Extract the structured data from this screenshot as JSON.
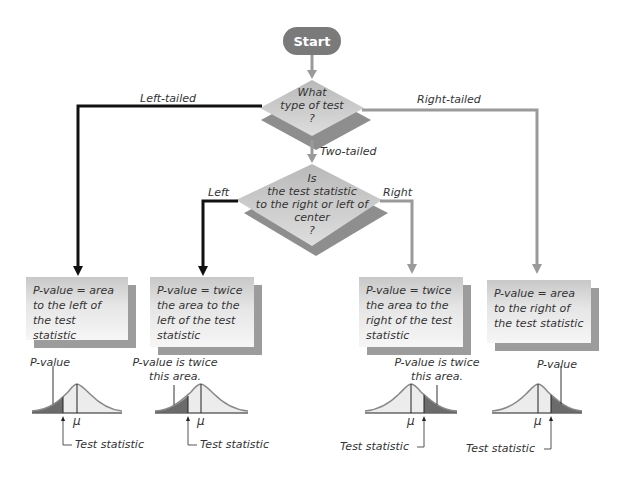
{
  "start": {
    "label": "Start"
  },
  "decision1": {
    "lines": [
      "What",
      "type of test",
      "?"
    ]
  },
  "decision2": {
    "lines": [
      "Is",
      "the test statistic",
      "to the right or left of",
      "center",
      "?"
    ]
  },
  "branches": {
    "left_tailed": "Left-tailed",
    "right_tailed": "Right-tailed",
    "two_tailed": "Two-tailed",
    "left": "Left",
    "right": "Right"
  },
  "boxes": [
    {
      "text": "P-value = area to the left of the test statistic"
    },
    {
      "text": "P-value = twice the area to the left of the test statistic"
    },
    {
      "text": "P-value = twice the area to the right of the test statistic"
    },
    {
      "text": "P-value = area to the right of the test statistic"
    }
  ],
  "curves": [
    {
      "label": "P-value",
      "mu": "μ",
      "stat_label": "Test statistic",
      "shaded_side": "left"
    },
    {
      "label": "P-value is twice this area.",
      "mu": "μ",
      "stat_label": "Test statistic",
      "shaded_side": "left"
    },
    {
      "label": "P-value is twice this area.",
      "mu": "μ",
      "stat_label": "Test statistic",
      "shaded_side": "right"
    },
    {
      "label": "P-value",
      "mu": "μ",
      "stat_label": "Test statistic",
      "shaded_side": "right"
    }
  ],
  "colors": {
    "dark_line": "#111111",
    "gray_line": "#9a9a9a",
    "diamond": "#c9c9c9",
    "diamond_shadow": "#8e8e8e",
    "start_fill": "#7a7a7a",
    "shaded_area": "#6b6b6b",
    "curve_fill": "#ececec"
  }
}
